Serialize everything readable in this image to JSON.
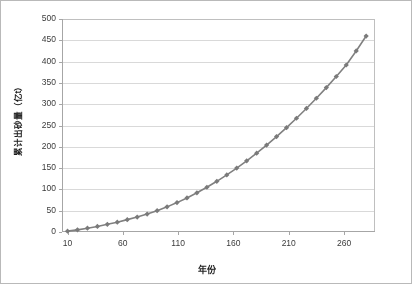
{
  "chart_data": {
    "type": "line",
    "title": "",
    "subtitle": "",
    "xlabel": "年份",
    "ylabel": "累计出砂量（亿t）",
    "xlim": [
      5,
      288
    ],
    "ylim": [
      0,
      500
    ],
    "xticks": [
      10,
      60,
      110,
      160,
      210,
      260
    ],
    "yticks": [
      0,
      50,
      100,
      150,
      200,
      250,
      300,
      350,
      400,
      450,
      500
    ],
    "grid": "horizontal",
    "legend": "none",
    "marker": "diamond",
    "line_color": "#808080",
    "marker_color": "#7a7a7a",
    "gridline_color": "#d9d9d9",
    "plot_border_color": "#bfbfbf",
    "series": [
      {
        "name": "累计出砂量",
        "x": [
          10,
          19,
          28,
          37,
          46,
          55,
          64,
          73,
          82,
          91,
          100,
          109,
          118,
          127,
          136,
          145,
          154,
          163,
          172,
          181,
          190,
          199,
          208,
          217,
          226,
          235,
          244,
          253,
          262,
          271,
          280
        ],
        "values": [
          2,
          5,
          9,
          13,
          18,
          23,
          29,
          35,
          42,
          50,
          59,
          69,
          80,
          92,
          105,
          119,
          134,
          150,
          167,
          185,
          204,
          224,
          245,
          267,
          290,
          314,
          339,
          365,
          392,
          425,
          460
        ]
      }
    ]
  },
  "axes": {
    "y_title": "累计出砂量（亿t）",
    "x_title": "年份"
  }
}
